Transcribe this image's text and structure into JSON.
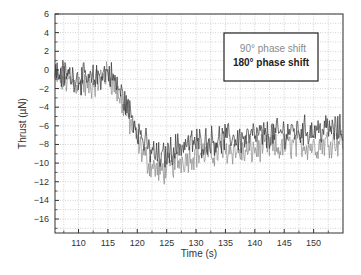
{
  "chart_data": {
    "type": "line",
    "title": "",
    "xlabel": "Time (s)",
    "ylabel": "Thrust (µN)",
    "xlim": [
      106,
      155
    ],
    "ylim": [
      -17.5,
      6
    ],
    "x_ticks": [
      110,
      115,
      120,
      125,
      130,
      135,
      140,
      145,
      150
    ],
    "x_tick_labels": [
      "110",
      "115",
      "120",
      "125",
      "130",
      "135",
      "140",
      "145",
      "150"
    ],
    "y_ticks": [
      6,
      4,
      2,
      0,
      -2,
      -4,
      -6,
      -8,
      -10,
      -12,
      -14,
      -16
    ],
    "y_tick_labels": [
      "6",
      "4",
      "2",
      "0",
      "−2",
      "−4",
      "−6",
      "−8",
      "−10",
      "−12",
      "−14",
      "−16"
    ],
    "grid": true,
    "legend_position": "top-right",
    "series": [
      {
        "name": "90° phase shift",
        "color": "#8a8a8a",
        "x": [
          106,
          108,
          110,
          112,
          114,
          115,
          116,
          117,
          118,
          119,
          120,
          121,
          122,
          123,
          124,
          125,
          126,
          127,
          128,
          130,
          132,
          134,
          136,
          138,
          140,
          142,
          144,
          146,
          148,
          150,
          152,
          155
        ],
        "y": [
          -0.8,
          -1.2,
          -1.5,
          -1.8,
          -0.8,
          -0.5,
          -1.5,
          -3.0,
          -4.5,
          -6.0,
          -7.5,
          -9.0,
          -10.0,
          -10.5,
          -11.0,
          -10.5,
          -10.2,
          -9.8,
          -9.5,
          -9.0,
          -9.0,
          -8.8,
          -8.5,
          -9.0,
          -8.5,
          -8.2,
          -8.5,
          -8.0,
          -8.0,
          -8.2,
          -7.8,
          -7.5
        ]
      },
      {
        "name": "180° phase shift",
        "color": "#333333",
        "x": [
          106,
          108,
          110,
          112,
          114,
          115,
          116,
          117,
          118,
          119,
          120,
          121,
          122,
          123,
          124,
          125,
          126,
          127,
          128,
          130,
          132,
          134,
          136,
          138,
          140,
          142,
          144,
          146,
          148,
          150,
          152,
          155
        ],
        "y": [
          -0.3,
          -0.5,
          -0.8,
          -1.2,
          -0.5,
          -0.2,
          -1.0,
          -2.2,
          -3.5,
          -4.8,
          -6.2,
          -7.5,
          -8.5,
          -9.0,
          -9.5,
          -9.0,
          -8.5,
          -8.2,
          -8.0,
          -7.8,
          -7.6,
          -7.5,
          -7.2,
          -7.5,
          -7.0,
          -7.0,
          -6.8,
          -6.5,
          -6.5,
          -6.5,
          -6.3,
          -6.5
        ]
      }
    ]
  }
}
